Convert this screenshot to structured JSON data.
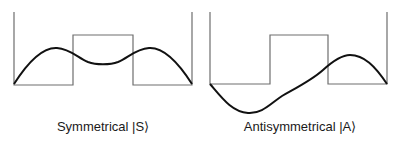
{
  "panels": [
    {
      "id": "symmetrical",
      "label": "Symmetrical |S⟩",
      "potential": {
        "type": "double-well with central barrier",
        "stroke": "#6e6e6e"
      },
      "wavefunction": {
        "parity": "even",
        "shape": "two peaks in wells, nonzero dip under barrier",
        "stroke": "#111111"
      }
    },
    {
      "id": "antisymmetrical",
      "label": "Antisymmetrical |A⟩",
      "potential": {
        "type": "double-well with central barrier",
        "stroke": "#6e6e6e"
      },
      "wavefunction": {
        "parity": "odd",
        "shape": "negative lobe in left well, positive lobe in right well, node under barrier",
        "stroke": "#111111"
      }
    }
  ]
}
